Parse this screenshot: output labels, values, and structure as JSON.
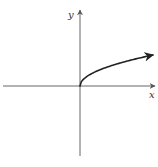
{
  "chart_data": {
    "type": "line",
    "title": "",
    "xlabel": "x",
    "ylabel": "y",
    "function": "y = sqrt(x)",
    "grid": false,
    "legend": null,
    "axes": {
      "x_range": [
        -1,
        1
      ],
      "y_range": [
        -1,
        1
      ],
      "arrows": [
        "x-positive",
        "y-positive"
      ]
    },
    "series": [
      {
        "name": "sqrt(x)",
        "x": [
          0,
          0.01,
          0.05,
          0.1,
          0.2,
          0.3,
          0.4,
          0.5,
          0.6,
          0.7,
          0.8,
          0.9,
          1.0
        ],
        "y": [
          0,
          0.1,
          0.22,
          0.32,
          0.45,
          0.55,
          0.63,
          0.71,
          0.77,
          0.84,
          0.89,
          0.95,
          1.0
        ],
        "end_arrow": true
      }
    ]
  },
  "colors": {
    "axis": "#555555",
    "curve": "#222222",
    "label": "#333333"
  }
}
